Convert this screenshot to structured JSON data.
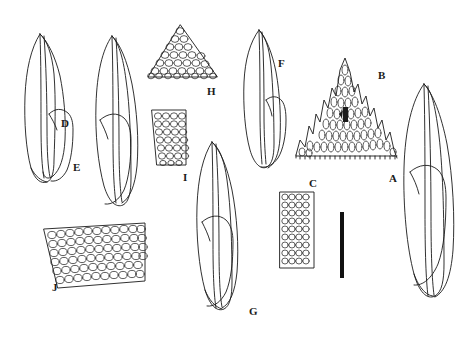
{
  "plate": {
    "kind": "botanical-line-drawing-plate",
    "subject": "moss leaves and leaf cell areolation",
    "background_color": "#ffffff",
    "ink_color": "#1a1a1a",
    "width": 467,
    "height": 338,
    "panel_count": 10
  },
  "labels": [
    {
      "id": "A",
      "text": "A",
      "x": 389,
      "y": 173,
      "describes": "whole leaf, large, long-acuminate apex"
    },
    {
      "id": "B",
      "text": "B",
      "x": 378,
      "y": 70,
      "describes": "leaf apex with toothed margin and cell areolation"
    },
    {
      "id": "C",
      "text": "C",
      "x": 309,
      "y": 178,
      "describes": "narrow strip of laminal cells"
    },
    {
      "id": "D",
      "text": "D",
      "x": 61,
      "y": 118,
      "describes": "whole leaf, lanceolate"
    },
    {
      "id": "E",
      "text": "E",
      "x": 73,
      "y": 162,
      "describes": "whole leaf, broadly lanceolate"
    },
    {
      "id": "F",
      "text": "F",
      "x": 278,
      "y": 58,
      "describes": "whole leaf, oblong-lanceolate"
    },
    {
      "id": "G",
      "text": "G",
      "x": 249,
      "y": 306,
      "describes": "whole leaf, obtuse apex"
    },
    {
      "id": "H",
      "text": "H",
      "x": 207,
      "y": 86,
      "describes": "leaf apex cells, triangular patch"
    },
    {
      "id": "I",
      "text": "I",
      "x": 183,
      "y": 172,
      "describes": "rectangular patch of leaf cells"
    },
    {
      "id": "J",
      "text": "J",
      "x": 52,
      "y": 282,
      "describes": "broad patch of laminal cells"
    }
  ],
  "scale_bar": {
    "orientation": "vertical",
    "x": 340,
    "y": 212,
    "width": 4,
    "height": 66,
    "color": "#111111",
    "caption": ""
  }
}
